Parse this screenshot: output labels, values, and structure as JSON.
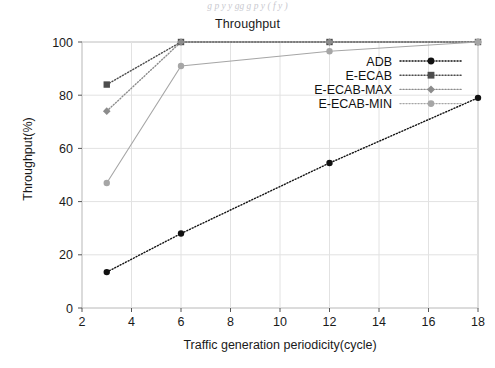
{
  "figure": {
    "caption_above": "g p y   y         gg    g             p        y (          f  y   )",
    "background_color": "#ffffff"
  },
  "chart_data": {
    "type": "line",
    "title": "Throughput",
    "xlabel": "Traffic generation periodicity(cycle)",
    "ylabel": "Throughput(%)",
    "xlim": [
      2,
      18
    ],
    "ylim": [
      0,
      100
    ],
    "xticks": [
      2,
      4,
      6,
      8,
      10,
      12,
      14,
      16,
      18
    ],
    "yticks": [
      0,
      20,
      40,
      60,
      80,
      100
    ],
    "grid": true,
    "grid_color": "#e2e2e2",
    "legend_position": "upper-right-inside",
    "x": [
      3,
      6,
      12,
      18
    ],
    "series": [
      {
        "name": "ADB",
        "values": [
          13.5,
          28,
          54.5,
          79
        ],
        "color": "#111111",
        "marker": "circle",
        "linestyle": "dotted"
      },
      {
        "name": "E-ECAB",
        "values": [
          84,
          100,
          100,
          100
        ],
        "color": "#4d4d4d",
        "marker": "square",
        "linestyle": "dotted"
      },
      {
        "name": "E-ECAB-MAX",
        "values": [
          74,
          100,
          100,
          100
        ],
        "color": "#8c8c8c",
        "marker": "diamond",
        "linestyle": "dotted"
      },
      {
        "name": "E-ECAB-MIN",
        "values": [
          47,
          91,
          96.5,
          100
        ],
        "color": "#a6a6a6",
        "marker": "circle",
        "linestyle": "solid"
      }
    ]
  },
  "axis": {
    "ytick_labels": [
      "0",
      "20",
      "40",
      "60",
      "80",
      "100"
    ],
    "xtick_labels": [
      "2",
      "4",
      "6",
      "8",
      "10",
      "12",
      "14",
      "16",
      "18"
    ]
  },
  "legend": {
    "entries": [
      {
        "label": "ADB"
      },
      {
        "label": "E-ECAB"
      },
      {
        "label": "E-ECAB-MAX"
      },
      {
        "label": "E-ECAB-MIN"
      }
    ]
  }
}
